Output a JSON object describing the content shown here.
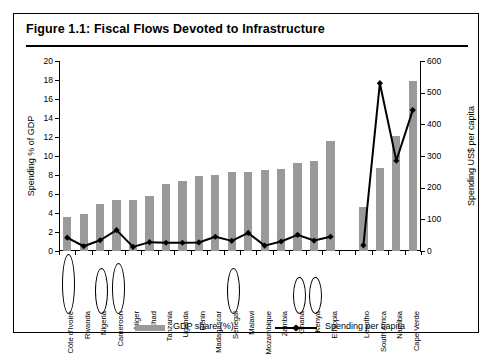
{
  "figure": {
    "title": "Figure 1.1: Fiscal Flows Devoted to Infrastructure"
  },
  "legend": {
    "bar_label": "GDP share (%)",
    "line_label": "Spending per capita"
  },
  "colors": {
    "bar": "#9a9a9a",
    "line": "#000000",
    "frame": "#000000",
    "background": "#ffffff"
  },
  "chart_data": {
    "type": "bar",
    "title": "Figure 1.1: Fiscal Flows Devoted to Infrastructure",
    "xlabel": "",
    "ylabel": "Spending % of GDP",
    "y2label": "Spending US$ per capita",
    "ylim": [
      0,
      20
    ],
    "y2lim": [
      0,
      600
    ],
    "yticks": [
      0,
      2,
      4,
      6,
      8,
      10,
      12,
      14,
      16,
      18,
      20
    ],
    "y2ticks": [
      0,
      100,
      200,
      300,
      400,
      500,
      600
    ],
    "grid": false,
    "legend_position": "bottom",
    "categories": [
      "Côte d'Ivoire",
      "Rwanda",
      "Nigeria",
      "Cameroon",
      "Niger",
      "Chad",
      "Tanzania",
      "Uganda",
      "Benin",
      "Madagascar",
      "Senegal",
      "Malawi",
      "Mozambique",
      "Zambia",
      "Ghana",
      "Kenya",
      "Ethiopia",
      "Lesotho",
      "South Africa",
      "Namibia",
      "Cape Verde"
    ],
    "group_break_after_index": 16,
    "circled_categories": [
      "Côte d'Ivoire",
      "Nigeria",
      "Cameroon",
      "Senegal",
      "Ghana",
      "Kenya"
    ],
    "series": [
      {
        "name": "GDP share (%)",
        "type": "bar",
        "axis": "left",
        "values": [
          3.6,
          3.9,
          4.9,
          5.4,
          5.4,
          5.8,
          7.1,
          7.4,
          7.9,
          8.0,
          8.3,
          8.3,
          8.5,
          8.6,
          9.3,
          9.5,
          11.6,
          4.6,
          8.7,
          12.1,
          17.9
        ]
      },
      {
        "name": "Spending per capita",
        "type": "line",
        "axis": "right",
        "values": [
          42,
          15,
          34,
          66,
          13,
          28,
          26,
          26,
          27,
          45,
          32,
          57,
          17,
          30,
          51,
          33,
          45,
          18,
          530,
          285,
          445
        ]
      }
    ]
  }
}
